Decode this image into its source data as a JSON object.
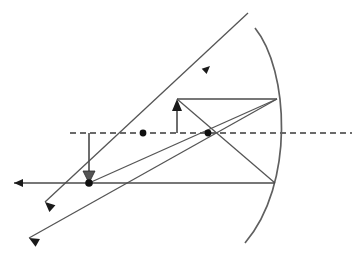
{
  "figure": {
    "background_color": "#ffffff",
    "line_color": "#4a4a4a",
    "axis_color": "#3a3a3a",
    "marker_color": "#101010",
    "width": 357,
    "height": 259
  },
  "geometry": {
    "principal_axis": {
      "name": "principal-axis",
      "style": "dashed",
      "y": 133,
      "x_start": 70,
      "x_end": 352,
      "path": "M70,133 L352,133"
    },
    "mirror": {
      "name": "concave-mirror",
      "orientation": "concave-left",
      "path": "M255,28 C289,70 295,185 245,243",
      "vertex": {
        "x": 292,
        "y": 133
      },
      "top_end": {
        "x": 255,
        "y": 28
      },
      "bottom_end": {
        "x": 245,
        "y": 243
      }
    },
    "focal_point": {
      "name": "focal-point",
      "label": "F",
      "x": 143,
      "y": 133,
      "radius": 3.4
    },
    "center_of_curvature": {
      "name": "center-of-curvature",
      "label": "C",
      "x": 208,
      "y": 133,
      "radius": 3.4
    },
    "object_arrow": {
      "name": "object-arrow",
      "direction": "up",
      "base": {
        "x": 177,
        "y": 133
      },
      "tip": {
        "x": 177,
        "y": 99
      },
      "shaft_path": "M177,133 L177,110"
    },
    "image_arrow": {
      "name": "image-arrow",
      "direction": "down",
      "base": {
        "x": 89,
        "y": 133
      },
      "tip": {
        "x": 89,
        "y": 183
      },
      "shaft_path": "M89,133 L89,176"
    },
    "rays": [
      {
        "name": "parallel-incident-ray",
        "description": "Horizontal ray from object tip travelling parallel to the principal axis to the mirror surface.",
        "path": "M177,99 L277,99"
      },
      {
        "name": "reflected-ray-through-focus",
        "description": "Ray reflected from the mirror at the parallel-ray strike point back through the focal point and diverging to the lower left.",
        "path": "M277,99 L29,238"
      },
      {
        "name": "ray-through-center-of-curvature",
        "description": "Ray from object tip through the centre of curvature to the mirror, reflected back along itself toward the lower left.",
        "path": "M248,13 L45,202"
      },
      {
        "name": "chief-ray-to-vertex",
        "description": "Ray from object tip to the lower mirror point and reflected out to the left along the horizontal.",
        "path": "M177,99 L275,183"
      },
      {
        "name": "reflected-horizontal-ray",
        "description": "Reflected horizontal ray running left from the lower mirror strike point past the image point.",
        "path": "M275,183 L14,183"
      },
      {
        "name": "upper-construction-line",
        "description": "Construction line from the mirror vertex region to the focal region crossing the axis.",
        "path": "M277,99 L89,183"
      }
    ],
    "arrowheads": [
      {
        "name": "arrowhead-left-horizontal-ray",
        "x": 14,
        "y": 183,
        "angle": 180
      },
      {
        "name": "arrowhead-lower-diagonal-ray",
        "x": 45,
        "y": 202,
        "angle": 222
      },
      {
        "name": "arrowhead-lowest-diagonal-ray",
        "x": 29,
        "y": 238,
        "angle": 209
      },
      {
        "name": "arrowhead-incident-ray-direction",
        "x": 210,
        "y": 66,
        "angle": 317
      },
      {
        "name": "arrowhead-object-tip",
        "x": 177,
        "y": 99,
        "angle": 270
      },
      {
        "name": "arrowhead-image-tip",
        "x": 89,
        "y": 183,
        "angle": 90
      }
    ]
  },
  "labels": {
    "none_visible": "",
    "note": "This figure contains no rendered text labels."
  }
}
